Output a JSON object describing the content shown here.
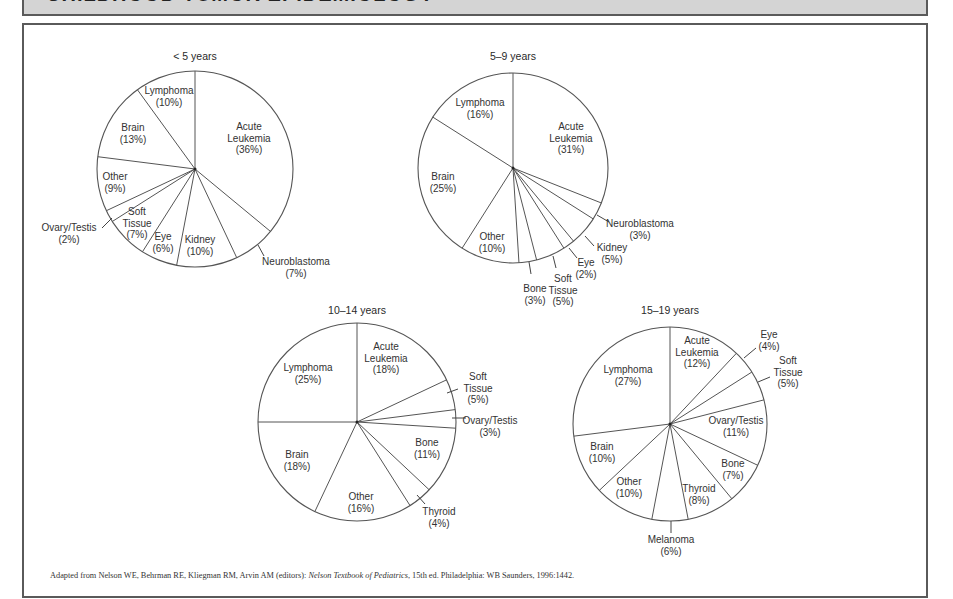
{
  "header": {
    "title": "CHILDHOOD TUMOR EPIDEMIOLOGY"
  },
  "footer": {
    "prefix": "Adapted from Nelson WE, Behrman RE, Kliegman RM, Arvin AM (editors): ",
    "book": "Nelson Textbook of Pediatrics",
    "suffix": ", 15th ed. Philadelphia: WB Saunders, 1996:1442."
  },
  "chart_data": [
    {
      "type": "pie",
      "title": "< 5 years",
      "start": "12 o'clock, clockwise",
      "categories": [
        "Acute Leukemia",
        "Neuroblastoma",
        "Kidney",
        "Eye",
        "Soft Tissue",
        "Ovary/Testis",
        "Other",
        "Brain",
        "Lymphoma"
      ],
      "values": [
        36,
        7,
        10,
        6,
        7,
        2,
        9,
        13,
        10
      ],
      "unit": "%"
    },
    {
      "type": "pie",
      "title": "5–9 years",
      "start": "12 o'clock, clockwise",
      "categories": [
        "Acute Leukemia",
        "Neuroblastoma",
        "Kidney",
        "Eye",
        "Soft Tissue",
        "Bone",
        "Other",
        "Brain",
        "Lymphoma"
      ],
      "values": [
        31,
        3,
        5,
        2,
        5,
        3,
        10,
        25,
        16
      ],
      "unit": "%"
    },
    {
      "type": "pie",
      "title": "10–14 years",
      "start": "12 o'clock, clockwise",
      "categories": [
        "Acute Leukemia",
        "Soft Tissue",
        "Ovary/Testis",
        "Bone",
        "Thyroid",
        "Other",
        "Brain",
        "Lymphoma"
      ],
      "values": [
        18,
        5,
        3,
        11,
        4,
        16,
        18,
        25
      ],
      "unit": "%"
    },
    {
      "type": "pie",
      "title": "15–19 years",
      "start": "12 o'clock, clockwise",
      "categories": [
        "Acute Leukemia",
        "Eye",
        "Soft Tissue",
        "Ovary/Testis",
        "Bone",
        "Thyroid",
        "Melanoma",
        "Other",
        "Brain",
        "Lymphoma"
      ],
      "values": [
        12,
        4,
        5,
        11,
        7,
        8,
        6,
        10,
        10,
        27
      ],
      "unit": "%"
    }
  ],
  "layout": {
    "pies": [
      {
        "cx": 195,
        "cy": 169,
        "r": 98,
        "title_x": 195,
        "title_y": 60,
        "labels": [
          {
            "lines": [
              "Acute",
              "Leukemia",
              "(36%)"
            ],
            "x": 249,
            "y": 130
          },
          {
            "lines": [
              "Neuroblastoma",
              "(7%)"
            ],
            "x": 296,
            "y": 265,
            "leader": [
              258,
              245,
              264,
              256
            ]
          },
          {
            "lines": [
              "Kidney",
              "(10%)"
            ],
            "x": 200,
            "y": 243
          },
          {
            "lines": [
              "Eye",
              "(6%)"
            ],
            "x": 163,
            "y": 240
          },
          {
            "lines": [
              "Soft",
              "Tissue",
              "(7%)"
            ],
            "x": 137,
            "y": 215
          },
          {
            "lines": [
              "Ovary/Testis",
              "(2%)"
            ],
            "x": 69,
            "y": 231,
            "leader": [
              102,
              228,
              112,
              218
            ]
          },
          {
            "lines": [
              "Other",
              "(9%)"
            ],
            "x": 115,
            "y": 180
          },
          {
            "lines": [
              "Brain",
              "(13%)"
            ],
            "x": 133,
            "y": 131
          },
          {
            "lines": [
              "Lymphoma",
              "(10%)"
            ],
            "x": 169,
            "y": 94
          }
        ]
      },
      {
        "cx": 513,
        "cy": 168,
        "r": 95,
        "title_x": 513,
        "title_y": 60,
        "labels": [
          {
            "lines": [
              "Acute",
              "Leukemia",
              "(31%)"
            ],
            "x": 571,
            "y": 130
          },
          {
            "lines": [
              "Neuroblastoma",
              "(3%)"
            ],
            "x": 640,
            "y": 227,
            "leader": [
              597,
              215,
              609,
              222
            ]
          },
          {
            "lines": [
              "Kidney",
              "(5%)"
            ],
            "x": 612,
            "y": 251,
            "leader": [
              585,
              236,
              594,
              246
            ]
          },
          {
            "lines": [
              "Eye",
              "(2%)"
            ],
            "x": 586,
            "y": 266,
            "leader": [
              569,
              248,
              577,
              258
            ]
          },
          {
            "lines": [
              "Soft",
              "Tissue",
              "(5%)"
            ],
            "x": 563,
            "y": 282,
            "leader": [
              553,
              256,
              556,
              268
            ]
          },
          {
            "lines": [
              "Bone",
              "(3%)"
            ],
            "x": 535,
            "y": 292,
            "leader": [
              529,
              262,
              531,
              274
            ]
          },
          {
            "lines": [
              "Other",
              "(10%)"
            ],
            "x": 492,
            "y": 240
          },
          {
            "lines": [
              "Brain",
              "(25%)"
            ],
            "x": 443,
            "y": 180
          },
          {
            "lines": [
              "Lymphoma",
              "(16%)"
            ],
            "x": 480,
            "y": 106
          }
        ]
      },
      {
        "cx": 357,
        "cy": 422,
        "r": 99,
        "title_x": 357,
        "title_y": 314,
        "labels": [
          {
            "lines": [
              "Acute",
              "Leukemia",
              "(18%)"
            ],
            "x": 386,
            "y": 350
          },
          {
            "lines": [
              "Soft",
              "Tissue",
              "(5%)"
            ],
            "x": 478,
            "y": 380,
            "leader": [
              447,
              393,
              458,
              389
            ]
          },
          {
            "lines": [
              "Ovary/Testis",
              "(3%)"
            ],
            "x": 490,
            "y": 424,
            "leader": [
              452,
              418,
              466,
              418
            ]
          },
          {
            "lines": [
              "Bone",
              "(11%)"
            ],
            "x": 427,
            "y": 446
          },
          {
            "lines": [
              "Thyroid",
              "(4%)"
            ],
            "x": 439,
            "y": 515,
            "leader": [
              417,
              495,
              425,
              504
            ]
          },
          {
            "lines": [
              "Other",
              "(16%)"
            ],
            "x": 361,
            "y": 500
          },
          {
            "lines": [
              "Brain",
              "(18%)"
            ],
            "x": 297,
            "y": 458
          },
          {
            "lines": [
              "Lymphoma",
              "(25%)"
            ],
            "x": 308,
            "y": 371
          }
        ]
      },
      {
        "cx": 670,
        "cy": 424,
        "r": 97,
        "title_x": 670,
        "title_y": 314,
        "labels": [
          {
            "lines": [
              "Acute",
              "Leukemia",
              "(12%)"
            ],
            "x": 697,
            "y": 344
          },
          {
            "lines": [
              "Eye",
              "(4%)"
            ],
            "x": 769,
            "y": 338,
            "leader": [
              744,
              358,
              756,
              348
            ]
          },
          {
            "lines": [
              "Soft",
              "Tissue",
              "(5%)"
            ],
            "x": 788,
            "y": 364,
            "leader": [
              758,
              382,
              770,
              377
            ]
          },
          {
            "lines": [
              "Ovary/Testis",
              "(11%)"
            ],
            "x": 736,
            "y": 424
          },
          {
            "lines": [
              "Bone",
              "(7%)"
            ],
            "x": 733,
            "y": 467
          },
          {
            "lines": [
              "Thyroid",
              "(8%)"
            ],
            "x": 699,
            "y": 492
          },
          {
            "lines": [
              "Melanoma",
              "(6%)"
            ],
            "x": 671,
            "y": 543,
            "leader": [
              671,
              521,
              671,
              533
            ]
          },
          {
            "lines": [
              "Other",
              "(10%)"
            ],
            "x": 629,
            "y": 485
          },
          {
            "lines": [
              "Brain",
              "(10%)"
            ],
            "x": 602,
            "y": 450
          },
          {
            "lines": [
              "Lymphoma",
              "(27%)"
            ],
            "x": 628,
            "y": 373
          }
        ]
      }
    ]
  }
}
